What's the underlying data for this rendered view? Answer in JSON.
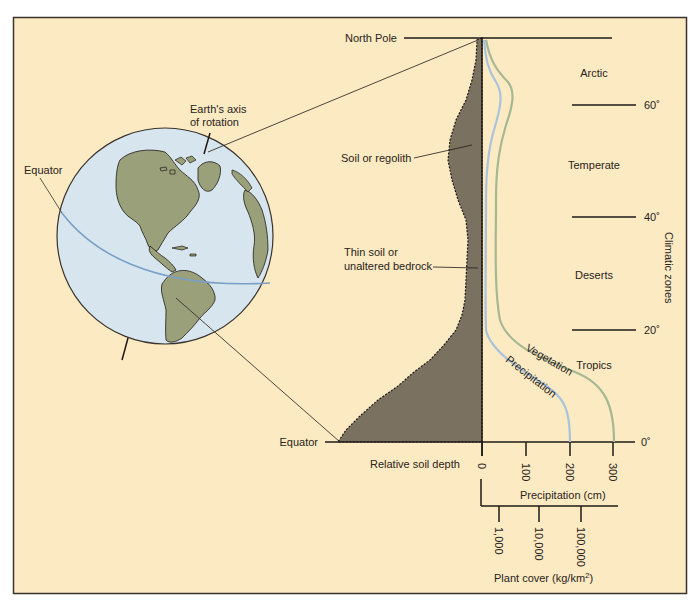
{
  "figure": {
    "background_color": "#fbeac2",
    "frame_color": "#3a332e",
    "soil_color": "#7b7160",
    "ocean_color": "#d7e6ee",
    "land_color": "#9aa07a",
    "equator_line_color": "#7a9fc6",
    "precip_curve_color": "#a9c3dc",
    "veg_curve_color": "#a6b893"
  },
  "globe": {
    "equator_label": "Equator",
    "axis_label_line1": "Earth's axis",
    "axis_label_line2": "of  rotation"
  },
  "soil_profile": {
    "north_pole_label": "North Pole",
    "equator_label": "Equator",
    "soil_label": "Soil or regolith",
    "thin_soil_label_line1": "Thin soil or",
    "thin_soil_label_line2": "unaltered bedrock",
    "axis_label": "Relative soil depth"
  },
  "curves": {
    "vegetation_label": "Vegetation",
    "precipitation_label": "Precipitation"
  },
  "climatic_zones": {
    "title": "Climatic zones",
    "zones": [
      "Arctic",
      "Temperate",
      "Deserts",
      "Tropics"
    ],
    "latitudes": [
      "60˚",
      "40˚",
      "20˚",
      "0˚"
    ]
  },
  "precipitation_axis": {
    "title": "Precipitation (cm)",
    "ticks": [
      "0",
      "100",
      "200",
      "300"
    ]
  },
  "plant_cover_axis": {
    "title": "Plant cover (kg/km",
    "title_sup": "2",
    "title_end": ")",
    "ticks": [
      "1,000",
      "10,000",
      "100,000"
    ]
  }
}
